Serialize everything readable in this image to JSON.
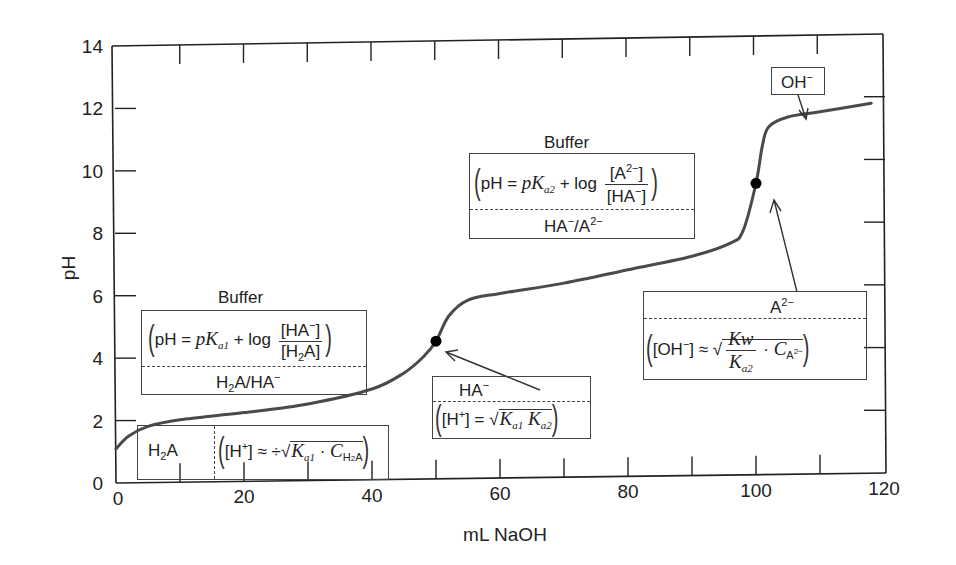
{
  "chart_data": {
    "type": "line",
    "title": "",
    "xlabel": "mL NaOH",
    "ylabel": "pH",
    "xlim": [
      0,
      120
    ],
    "ylim": [
      0,
      14
    ],
    "x_ticks": [
      0,
      20,
      40,
      60,
      80,
      100,
      120
    ],
    "y_ticks": [
      0,
      2,
      4,
      6,
      8,
      10,
      12,
      14
    ],
    "grid": false,
    "legend": null,
    "series": [
      {
        "name": "Titration of diprotic acid H2A with NaOH",
        "x": [
          0,
          2,
          5,
          10,
          20,
          30,
          40,
          45,
          48,
          50,
          52,
          55,
          60,
          70,
          80,
          90,
          96,
          98,
          100,
          101,
          102,
          105,
          110,
          118
        ],
        "y": [
          1.1,
          1.5,
          1.8,
          2.0,
          2.2,
          2.45,
          2.9,
          3.4,
          3.9,
          4.4,
          5.2,
          5.7,
          5.9,
          6.2,
          6.6,
          7.0,
          7.4,
          7.8,
          9.3,
          10.5,
          11.1,
          11.4,
          11.55,
          11.8
        ]
      }
    ],
    "markers": [
      {
        "name": "first equivalence point",
        "x": 50,
        "y": 4.4
      },
      {
        "name": "second equivalence point",
        "x": 100,
        "y": 9.3
      }
    ],
    "annotations": [
      {
        "id": "h2a",
        "text": "H2A | ([H+] ≈ √(Ka1 · C_H2A))"
      },
      {
        "id": "buffer1",
        "title": "Buffer",
        "text": "(pH = pKa1 + log [HA−]/[H2A]) — H2A/HA−"
      },
      {
        "id": "ha",
        "text": "HA− — ([H+] = √(Ka1 Ka2))"
      },
      {
        "id": "buffer2",
        "title": "Buffer",
        "text": "(pH = pKa2 + log [A2−]/[HA−]) — HA−/A2−"
      },
      {
        "id": "a2",
        "text": "A2− — ([OH−] ≈ √(Kw/Ka2 · C_A2−))"
      },
      {
        "id": "oh",
        "text": "OH−"
      }
    ]
  },
  "labels": {
    "xlabel": "mL NaOH",
    "ylabel": "pH",
    "buffer1_title": "Buffer",
    "buffer2_title": "Buffer",
    "oh_box": "OH",
    "oh_sup": "−",
    "h2a_species": "H",
    "h2a_sub": "2",
    "h2a_tail": "A",
    "pH_eq": "pH = ",
    "plus_log": " + log ",
    "pK": "pK",
    "a1": "a1",
    "a2": "a2",
    "HA": "[HA",
    "minus": "−",
    "close_br": "]",
    "H2A_br_open": "[H",
    "two": "2",
    "A_br": "A]",
    "A2_open": "[A",
    "two_minus": "2−",
    "pair1_a": "H",
    "pair1_b": "A/HA",
    "pair2_a": "HA",
    "pair2_b": "/A",
    "ha_species": "HA",
    "a2_species": "A",
    "Hplus_open": "[H",
    "plus": "+",
    "Hplus_close": "] = ",
    "Hplus_close_approx": "] ≈ ÷",
    "K": "K",
    "C": "C",
    "dot": " · ",
    "OH_open": "[OH",
    "OH_close": "] ≈ ",
    "Kw": "Kw",
    "H2A_sub_C": "H",
    "A_sub": "A"
  },
  "axis": {
    "x_ticks": [
      "0",
      "20",
      "40",
      "60",
      "80",
      "100",
      "120"
    ],
    "y_ticks": [
      "0",
      "2",
      "4",
      "6",
      "8",
      "10",
      "12",
      "14"
    ]
  },
  "colors": {
    "curve": "#4a4a4a",
    "axis": "#222222",
    "marker": "#000000"
  }
}
